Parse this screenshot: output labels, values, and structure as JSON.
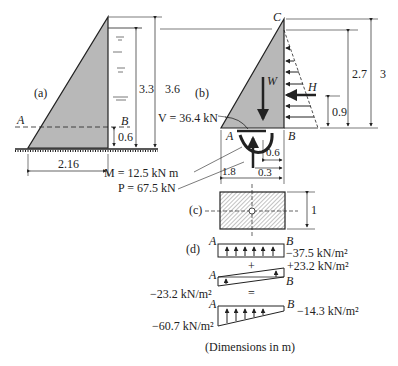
{
  "figure": {
    "caption": "(Dimensions in m)",
    "panel_a": {
      "label": "(a)",
      "point_a": "A",
      "point_b": "B",
      "dim_base": "2.16",
      "dim_water_height": "3.3",
      "dim_dam_height": "3.6",
      "dim_section_height": "0.6"
    },
    "panel_b": {
      "label": "(b)",
      "point_a": "A",
      "point_b": "B",
      "point_c": "C",
      "weight_label": "W",
      "thrust_label": "H",
      "shear": "V = 36.4 kN",
      "moment": "M = 12.5 kN m",
      "normal": "P = 67.5 kN",
      "dim_water": "2.7",
      "dim_total": "3",
      "dim_thrust_arm": "0.9",
      "dim_width": "1.8",
      "dim_w_offset": "0.6",
      "dim_p_offset": "0.3"
    },
    "panel_c": {
      "label": "(c)",
      "dim_depth": "1"
    },
    "panel_d": {
      "label": "(d)",
      "row1": {
        "a": "A",
        "b": "B",
        "value_b": "−37.5 kN/m²"
      },
      "plus": "+",
      "row2": {
        "a": "A",
        "b": "B",
        "value_b": "+23.2 kN/m²",
        "value_a": "−23.2 kN/m²"
      },
      "equals": "=",
      "row3": {
        "a": "A",
        "b": "B",
        "value_a": "−60.7 kN/m²",
        "value_b": "−14.3 kN/m²"
      }
    }
  }
}
